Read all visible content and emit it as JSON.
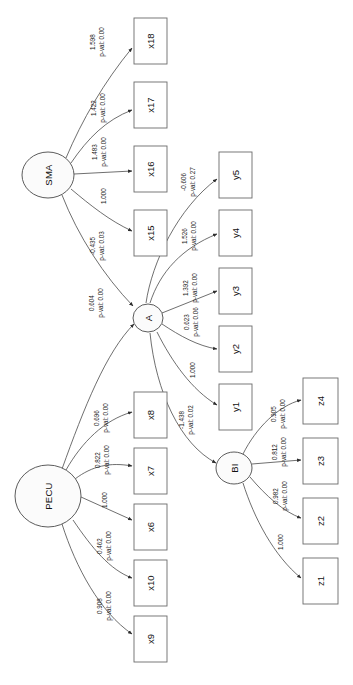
{
  "diagram": {
    "type": "sem-path-diagram",
    "orientation": "rotated-90-ccw",
    "background_color": "#ffffff",
    "node_stroke_color": "#4a4a4a",
    "box_stroke_color": "#6a6a6a",
    "text_color": "#111111",
    "latent_nodes": [
      {
        "id": "SMA",
        "label": "SMA",
        "shape": "ellipse",
        "cx": 48,
        "cy": 175,
        "rx": 26,
        "ry": 23
      },
      {
        "id": "A",
        "label": "A",
        "shape": "ellipse",
        "cx": 148,
        "cy": 318,
        "rx": 15,
        "ry": 14
      },
      {
        "id": "BI",
        "label": "BI",
        "shape": "ellipse",
        "cx": 234,
        "cy": 468,
        "rx": 18,
        "ry": 16
      },
      {
        "id": "PECU",
        "label": "PECU",
        "shape": "ellipse",
        "cx": 48,
        "cy": 496,
        "rx": 33,
        "ry": 31
      }
    ],
    "observed_nodes": [
      {
        "id": "x18",
        "label": "x18",
        "shape": "rect",
        "x": 134,
        "y": 18,
        "w": 33,
        "h": 46
      },
      {
        "id": "x17",
        "label": "x17",
        "shape": "rect",
        "x": 134,
        "y": 82,
        "w": 33,
        "h": 46
      },
      {
        "id": "x16",
        "label": "x16",
        "shape": "rect",
        "x": 134,
        "y": 146,
        "w": 33,
        "h": 46
      },
      {
        "id": "x15",
        "label": "x15",
        "shape": "rect",
        "x": 134,
        "y": 210,
        "w": 33,
        "h": 46
      },
      {
        "id": "y5",
        "label": "y5",
        "shape": "rect",
        "x": 219,
        "y": 152,
        "w": 33,
        "h": 46
      },
      {
        "id": "y4",
        "label": "y4",
        "shape": "rect",
        "x": 219,
        "y": 210,
        "w": 33,
        "h": 46
      },
      {
        "id": "y3",
        "label": "y3",
        "shape": "rect",
        "x": 219,
        "y": 268,
        "w": 33,
        "h": 46
      },
      {
        "id": "y2",
        "label": "y2",
        "shape": "rect",
        "x": 219,
        "y": 326,
        "w": 33,
        "h": 46
      },
      {
        "id": "y1",
        "label": "y1",
        "shape": "rect",
        "x": 219,
        "y": 384,
        "w": 33,
        "h": 46
      },
      {
        "id": "z4",
        "label": "z4",
        "shape": "rect",
        "x": 303,
        "y": 378,
        "w": 35,
        "h": 46
      },
      {
        "id": "z3",
        "label": "z3",
        "shape": "rect",
        "x": 303,
        "y": 438,
        "w": 35,
        "h": 46
      },
      {
        "id": "z2",
        "label": "z2",
        "shape": "rect",
        "x": 303,
        "y": 498,
        "w": 35,
        "h": 46
      },
      {
        "id": "z1",
        "label": "z1",
        "shape": "rect",
        "x": 303,
        "y": 558,
        "w": 35,
        "h": 46
      },
      {
        "id": "x8",
        "label": "x8",
        "shape": "rect",
        "x": 134,
        "y": 392,
        "w": 33,
        "h": 46
      },
      {
        "id": "x7",
        "label": "x7",
        "shape": "rect",
        "x": 134,
        "y": 448,
        "w": 33,
        "h": 46
      },
      {
        "id": "x6",
        "label": "x6",
        "shape": "rect",
        "x": 134,
        "y": 504,
        "w": 33,
        "h": 46
      },
      {
        "id": "x10",
        "label": "x10",
        "shape": "rect",
        "x": 134,
        "y": 560,
        "w": 33,
        "h": 46
      },
      {
        "id": "x9",
        "label": "x9",
        "shape": "rect",
        "x": 134,
        "y": 616,
        "w": 33,
        "h": 46
      }
    ],
    "edges": [
      {
        "from": "SMA",
        "to": "x18",
        "estimate": "1.598",
        "pval": "p-val: 0.00",
        "lx": 97,
        "ly": 42,
        "path": "M 66,158 C 82,120 104,82 132,48"
      },
      {
        "from": "SMA",
        "to": "x17",
        "estimate": "1.422",
        "pval": "p-val: 0.00",
        "lx": 98,
        "ly": 108,
        "path": "M 71,163 C 88,138 106,120 132,110"
      },
      {
        "from": "SMA",
        "to": "x16",
        "estimate": "1.483",
        "pval": "p-val: 0.00",
        "lx": 99,
        "ly": 152,
        "path": "M 74,174 L 132,171"
      },
      {
        "from": "SMA",
        "to": "x15",
        "estimate": "1.000",
        "pval": "",
        "lx": 103,
        "ly": 196,
        "path": "M 71,189 C 90,205 110,221 132,231"
      },
      {
        "from": "SMA",
        "to": "A",
        "estimate": "-0.435",
        "pval": "p-val: 0.03",
        "lx": 97,
        "ly": 246,
        "path": "M 62,195 C 78,236 104,276 133,306"
      },
      {
        "from": "PECU",
        "to": "A",
        "estimate": "0.604",
        "pval": "p-val: 0.00",
        "lx": 96,
        "ly": 303,
        "path": "M 62,469 C 84,408 106,352 134,324"
      },
      {
        "from": "A",
        "to": "y5",
        "estimate": "-0.606",
        "pval": "p-val: 0.27",
        "lx": 188,
        "ly": 182,
        "path": "M 146,303 C 152,262 178,208 217,179"
      },
      {
        "from": "A",
        "to": "y4",
        "estimate": "1.526",
        "pval": "p-val: 0.00",
        "lx": 189,
        "ly": 236,
        "path": "M 150,303 C 160,272 182,248 217,234"
      },
      {
        "from": "A",
        "to": "y3",
        "estimate": "1.392",
        "pval": "p-val: 0.00",
        "lx": 190,
        "ly": 288,
        "path": "M 162,313 L 217,291"
      },
      {
        "from": "A",
        "to": "y2",
        "estimate": "0.623",
        "pval": "p-val: 0.06",
        "lx": 191,
        "ly": 322,
        "path": "M 162,324 C 180,336 198,346 217,349"
      },
      {
        "from": "A",
        "to": "y1",
        "estimate": "1.000",
        "pval": "",
        "lx": 192,
        "ly": 370,
        "path": "M 157,332 C 172,362 192,390 217,405"
      },
      {
        "from": "A",
        "to": "BI",
        "estimate": "-1.438",
        "pval": "p-val: 0.02",
        "lx": 186,
        "ly": 420,
        "path": "M 150,333 C 156,392 180,444 216,463"
      },
      {
        "from": "BI",
        "to": "z4",
        "estimate": "0.905",
        "pval": "p-val: 0.00",
        "lx": 278,
        "ly": 414,
        "path": "M 243,454 C 256,428 278,406 301,400"
      },
      {
        "from": "BI",
        "to": "z3",
        "estimate": "0.812",
        "pval": "p-val: 0.00",
        "lx": 279,
        "ly": 452,
        "path": "M 252,464 L 301,460"
      },
      {
        "from": "BI",
        "to": "z2",
        "estimate": "0.982",
        "pval": "p-val: 0.00",
        "lx": 280,
        "ly": 496,
        "path": "M 250,477 C 266,496 284,512 301,518"
      },
      {
        "from": "BI",
        "to": "z1",
        "estimate": "1.000",
        "pval": "",
        "lx": 280,
        "ly": 542,
        "path": "M 243,483 C 254,518 274,556 301,578"
      },
      {
        "from": "PECU",
        "to": "x8",
        "estimate": "0.696",
        "pval": "p-val: 0.00",
        "lx": 101,
        "ly": 418,
        "path": "M 66,470 C 82,442 104,420 132,412"
      },
      {
        "from": "PECU",
        "to": "x7",
        "estimate": "0.822",
        "pval": "p-val: 0.00",
        "lx": 102,
        "ly": 460,
        "path": "M 75,479 C 92,466 110,462 132,466"
      },
      {
        "from": "PECU",
        "to": "x6",
        "estimate": "1.000",
        "pval": "",
        "lx": 104,
        "ly": 500,
        "path": "M 81,497 L 132,520"
      },
      {
        "from": "PECU",
        "to": "x10",
        "estimate": "0.462",
        "pval": "p-val: 0.00",
        "lx": 104,
        "ly": 546,
        "path": "M 73,520 C 92,548 110,570 132,578"
      },
      {
        "from": "PECU",
        "to": "x9",
        "estimate": "0.908",
        "pval": "p-val: 0.00",
        "lx": 104,
        "ly": 606,
        "path": "M 62,524 C 76,568 100,612 132,634"
      }
    ]
  }
}
